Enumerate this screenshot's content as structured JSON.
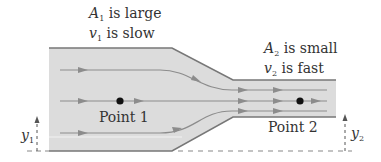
{
  "colors": {
    "pipe_fill": "#dcdcdc",
    "pipe_outline": "#777777",
    "streamline": "#8c8c8c",
    "point": "#111111",
    "text": "#333333",
    "dashed": "#888888"
  },
  "wide_section": {
    "area_var": "A",
    "area_sub": "1",
    "area_text": " is large",
    "velocity_var": "v",
    "velocity_sub": "1",
    "velocity_text": " is slow"
  },
  "narrow_section": {
    "area_var": "A",
    "area_sub": "2",
    "area_text": " is small",
    "velocity_var": "v",
    "velocity_sub": "2",
    "velocity_text": " is fast"
  },
  "points": [
    {
      "label": "Point 1",
      "x": 120,
      "y": 101
    },
    {
      "label": "Point 2",
      "x": 300,
      "y": 101
    }
  ],
  "heights": [
    {
      "var": "y",
      "sub": "1"
    },
    {
      "var": "y",
      "sub": "2"
    }
  ],
  "streamline_count": 3
}
